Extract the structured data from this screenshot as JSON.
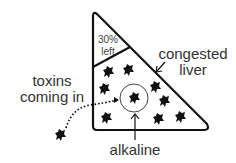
{
  "diagram": {
    "region_top": {
      "line1": "30%",
      "line2": "left"
    },
    "labels": {
      "congested_line1": "congested",
      "congested_line2": "liver",
      "toxins_line1": "toxins",
      "toxins_line2": "coming in",
      "alkaline": "alkaline"
    },
    "icons": {
      "toxin": "splat-blob-icon",
      "arrow": "arrow-icon"
    },
    "colors": {
      "stroke": "#111111",
      "text": "#333333",
      "background": "#ffffff"
    }
  }
}
